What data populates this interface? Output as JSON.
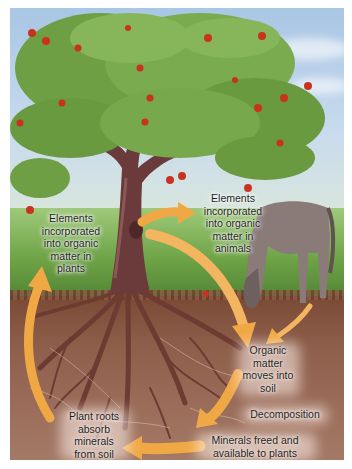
{
  "diagram": {
    "type": "nutrient-cycle",
    "labels": {
      "plants": "Elements incorporated into organic matter in plants",
      "animals": "Elements incorporated into organic matter in animals",
      "organic_to_soil": "Organic matter moves into soil",
      "decomposition": "Decomposition",
      "minerals_freed": "Minerals freed and available to plants",
      "roots_absorb": "Plant roots absorb minerals from soil"
    },
    "label_lines": {
      "plants": [
        "Elements",
        "incorporated",
        "into organic",
        "matter in",
        "plants"
      ],
      "animals": [
        "Elements",
        "incorporated",
        "into organic",
        "matter in",
        "animals"
      ],
      "organic_to_soil": [
        "Organic",
        "matter",
        "moves into",
        "soil"
      ],
      "decomposition": [
        "Decomposition"
      ],
      "minerals_freed": [
        "Minerals freed and",
        "available to plants"
      ],
      "roots_absorb": [
        "Plant roots",
        "absorb",
        "minerals",
        "from soil"
      ]
    },
    "elements": {
      "tree": "apple-tree",
      "animal": "horse-grazing",
      "ground": "soil-with-roots"
    },
    "colors": {
      "arrow": "#f0a845",
      "arrow_light": "#f6c27a",
      "sky": "#b7cfe8",
      "foliage": "#6f9f45",
      "trunk": "#6b3a3a",
      "soil": "#8d5e4a",
      "apple": "#c8321e",
      "horse": "#8a7a78",
      "text": "#1e1e1e"
    }
  }
}
